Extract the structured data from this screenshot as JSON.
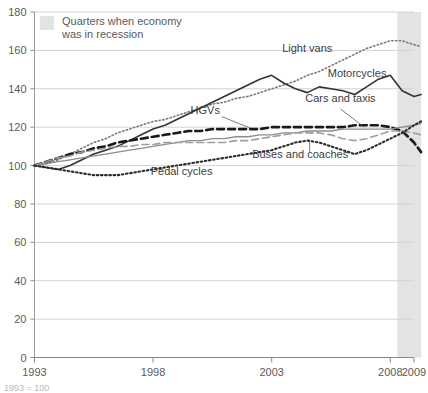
{
  "chart_data": {
    "type": "line",
    "title": "",
    "xlabel": "",
    "ylabel": "",
    "xlim": [
      1993,
      2009
    ],
    "ylim": [
      0,
      180
    ],
    "grid": true,
    "y_ticks": [
      0,
      20,
      40,
      60,
      80,
      100,
      120,
      140,
      160,
      180
    ],
    "x_ticks": [
      1993,
      1998,
      2003,
      2008,
      2009
    ],
    "x_tick_labels": [
      "1993",
      "1998",
      "2003",
      "2008",
      "2009"
    ],
    "index_base": "1993 = 100",
    "legend": {
      "position": "top-left-inside",
      "swatch_color": "#e3e3e3",
      "label_line1": "Quarters when economy",
      "label_line2": "was in recession"
    },
    "shaded_region": {
      "name": "recession",
      "x_start": 2008.3,
      "x_end": 2009.3,
      "color": "#e3e3e3"
    },
    "x": [
      1993,
      1993.5,
      1994,
      1994.5,
      1995,
      1995.5,
      1996,
      1996.5,
      1997,
      1997.5,
      1998,
      1998.5,
      1999,
      1999.5,
      2000,
      2000.5,
      2001,
      2001.5,
      2002,
      2002.5,
      2003,
      2003.5,
      2004,
      2004.5,
      2005,
      2005.5,
      2006,
      2006.5,
      2007,
      2007.5,
      2008,
      2008.5,
      2009,
      2009.3
    ],
    "series": [
      {
        "name": "Light vans",
        "style": "dotted",
        "color": "#7a7a7a",
        "label_x": 2004.5,
        "label_y": 159,
        "values": [
          100,
          101,
          103,
          106,
          109,
          112,
          114,
          117,
          119,
          121,
          123,
          124,
          126,
          128,
          130,
          132,
          133,
          135,
          136,
          138,
          140,
          142,
          144,
          147,
          149,
          152,
          155,
          158,
          161,
          163,
          165,
          165,
          163,
          162
        ]
      },
      {
        "name": "Motorcycles",
        "style": "solid",
        "color": "#333333",
        "label_x": 2006.6,
        "label_y": 146,
        "values": [
          100,
          99,
          98,
          100,
          103,
          106,
          108,
          110,
          113,
          116,
          119,
          121,
          124,
          127,
          130,
          133,
          136,
          139,
          142,
          145,
          147,
          143,
          140,
          138,
          141,
          140,
          139,
          137,
          141,
          145,
          147,
          139,
          136,
          137
        ]
      },
      {
        "name": "HGVs",
        "style": "dashed-bold",
        "color": "#1a1a1a",
        "label_x": 2000.2,
        "label_y": 127,
        "values": [
          100,
          102,
          104,
          106,
          107,
          109,
          110,
          112,
          113,
          114,
          115,
          116,
          117,
          118,
          118,
          119,
          119,
          119,
          119,
          119,
          120,
          120,
          120,
          120,
          120,
          120,
          120,
          121,
          121,
          121,
          120,
          118,
          112,
          107
        ]
      },
      {
        "name": "Cars and taxis",
        "style": "solid-thin-grey",
        "color": "#8c8c8c",
        "label_x": 2005.9,
        "label_y": 133,
        "values": [
          100,
          101,
          102,
          103,
          104,
          105,
          106,
          107,
          108,
          109,
          110,
          111,
          112,
          113,
          113,
          114,
          114,
          115,
          115,
          116,
          116,
          117,
          117,
          118,
          118,
          118,
          119,
          119,
          119,
          119,
          119,
          120,
          121,
          122
        ]
      },
      {
        "name": "Buses and coaches",
        "style": "dashed-grey",
        "color": "#9e9e9e",
        "label_x": 2004.2,
        "label_y": 104,
        "values": [
          100,
          102,
          104,
          105,
          107,
          108,
          109,
          110,
          110,
          111,
          111,
          112,
          112,
          112,
          112,
          112,
          112,
          113,
          113,
          114,
          115,
          116,
          117,
          117,
          117,
          116,
          114,
          113,
          114,
          116,
          118,
          118,
          117,
          116
        ]
      },
      {
        "name": "Pedal cycles",
        "style": "dotted-bold",
        "color": "#2b2b2b",
        "label_x": 1999.2,
        "label_y": 95,
        "values": [
          100,
          99,
          98,
          97,
          96,
          95,
          95,
          95,
          96,
          97,
          98,
          99,
          100,
          101,
          102,
          103,
          104,
          105,
          106,
          107,
          108,
          110,
          112,
          113,
          112,
          110,
          108,
          106,
          108,
          111,
          114,
          117,
          121,
          123
        ]
      }
    ]
  }
}
